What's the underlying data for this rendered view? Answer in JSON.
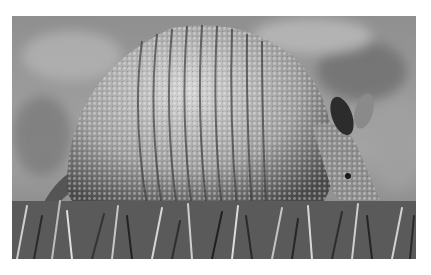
{
  "image": {
    "alt": "Grayscale photograph of a nine-banded armadillo walking through grass",
    "subject": "armadillo",
    "palette": {
      "background": "#ffffff",
      "blur_light": "#a8a8a8",
      "blur_dark": "#6e6e6e",
      "shell_light": "#d6d6d6",
      "shell_mid": "#9a9a9a",
      "shell_dark": "#3a3a3a",
      "grass_light": "#cfcfcf",
      "grass_dark": "#2a2a2a"
    }
  }
}
